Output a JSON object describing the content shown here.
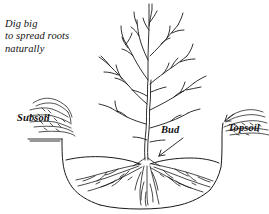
{
  "figure": {
    "background_color": "#ffffff",
    "ink_color": "#1a1a1a"
  },
  "annotations": {
    "instruction_note": "Dig big\nto spread roots\nnaturally",
    "subsoil_label": "Subsoil",
    "topsoil_label": "Topsoil",
    "bud_label": "Bud"
  },
  "icons": {
    "subsoil_pile": "soil-pile-icon",
    "topsoil_pile": "soil-pile-icon",
    "bud_pointer": "leader-line-arrow-icon",
    "topsoil_pointer": "leader-line-arrow-icon",
    "tree": "bare-tree-icon",
    "roots": "root-system-icon",
    "hole": "planting-hole-icon"
  }
}
